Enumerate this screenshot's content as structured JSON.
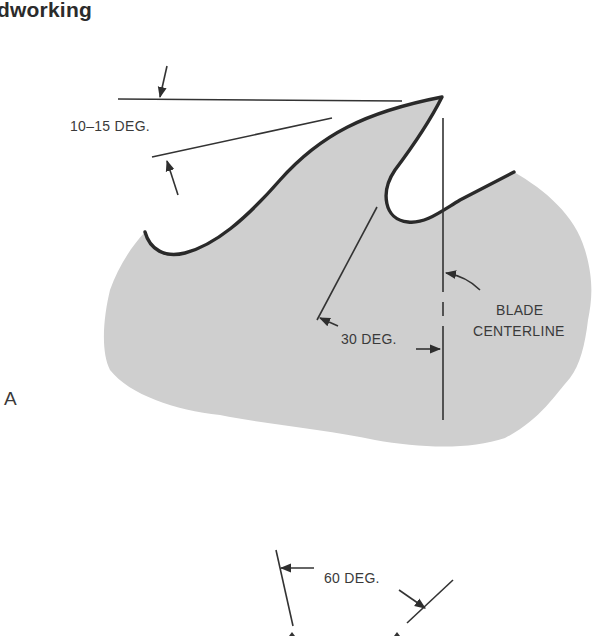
{
  "page": {
    "header_fragment": "dworking"
  },
  "figure": {
    "panel_label": "A",
    "colors": {
      "blade_fill": "#cfcfcf",
      "outline": "#2a2a2a",
      "dimension_line": "#333333",
      "text": "#3a3a3a",
      "background": "#ffffff"
    },
    "annotations": {
      "hook_angle": "10‒15 DEG.",
      "gullet_angle": "30 DEG.",
      "centerline_line1": "BLADE",
      "centerline_line2": "CENTERLINE",
      "second_figure_angle": "60 DEG."
    }
  }
}
